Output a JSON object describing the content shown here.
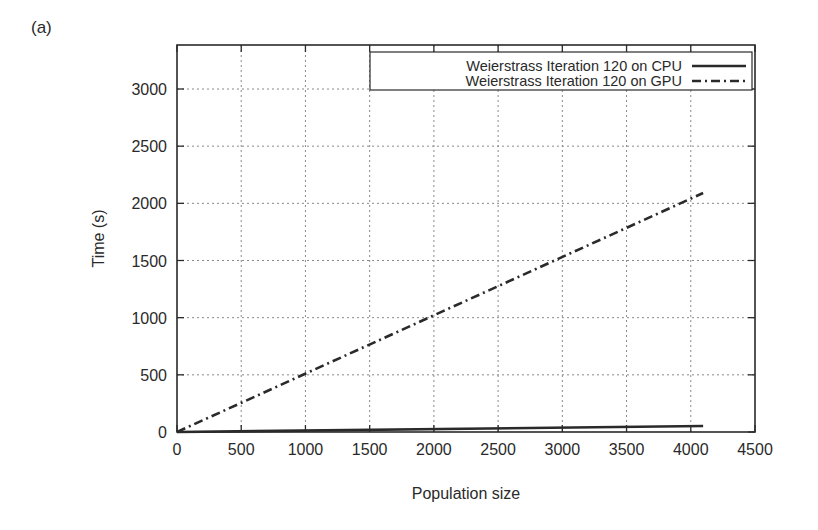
{
  "panel_label": "(a)",
  "chart_data": {
    "type": "line",
    "title": "",
    "xlabel": "Population size",
    "ylabel": "Time (s)",
    "xlim": [
      0,
      4500
    ],
    "ylim": [
      0,
      3400
    ],
    "xticks": [
      0,
      500,
      1000,
      1500,
      2000,
      2500,
      3000,
      3500,
      4000,
      4500
    ],
    "yticks": [
      0,
      500,
      1000,
      1500,
      2000,
      2500,
      3000
    ],
    "grid": true,
    "legend_position": "top-right",
    "series": [
      {
        "name": "Weierstrass Iteration 120 on CPU",
        "style": "solid",
        "x": [
          0,
          4096
        ],
        "y": [
          0,
          52
        ]
      },
      {
        "name": "Weierstrass Iteration 120 on GPU",
        "style": "dash-dot",
        "x": [
          0,
          4096
        ],
        "y": [
          0,
          2090
        ]
      }
    ]
  },
  "colors": {
    "line": "#2a2a2a",
    "grid": "#8a8a8a",
    "axis": "#2a2a2a"
  }
}
